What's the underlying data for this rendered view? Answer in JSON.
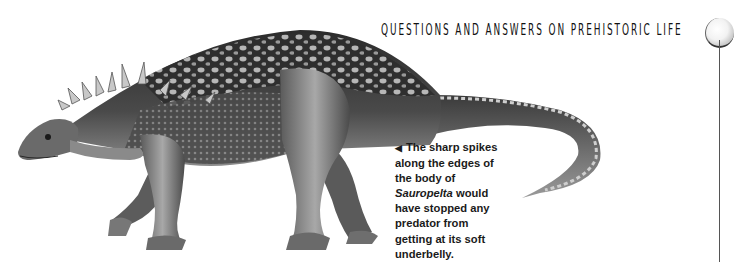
{
  "page": {
    "running_header": "QUESTIONS AND ANSWERS ON PREHISTORIC LIFE",
    "illustration": {
      "subject": "Sauropelta",
      "description": "Grayscale illustration of an armored dinosaur walking left, with sharp spikes along neck and body, studded back and long tapering tail"
    },
    "caption": {
      "pointer_icon": "◀",
      "line1": "The sharp spikes",
      "line2": "along the edges of",
      "line3": "the body of",
      "genus": "Sauropelta",
      "line4_rest": " would",
      "line5": "have stopped any",
      "line6": "predator from",
      "line7": "getting at its soft",
      "line8": "underbelly."
    },
    "colors": {
      "background": "#ffffff",
      "text": "#1a1a1a",
      "illustration_dark": "#2a2a2a",
      "illustration_mid": "#7a7a7a",
      "illustration_light": "#d0d0d0"
    }
  }
}
